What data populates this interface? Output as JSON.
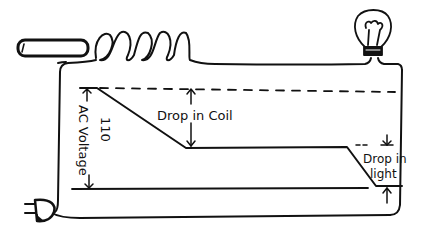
{
  "diagram": {
    "type": "circuit-voltage-drop",
    "colors": {
      "ink": "#111111",
      "background": "#ffffff"
    },
    "components": {
      "cord_end": "insulated-wire-stub",
      "coil": {
        "turns": 5
      },
      "lamp": "incandescent-bulb",
      "plug": "two-prong-plug"
    },
    "labels": {
      "ac_voltage": "AC Voltage",
      "voltage_value": "110",
      "drop_in_coil": "Drop in Coil",
      "drop_in_light_line1": "Drop in",
      "drop_in_light_line2": "light"
    }
  }
}
